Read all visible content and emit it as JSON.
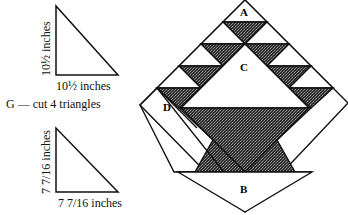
{
  "pattern_g": {
    "triangle_large": {
      "side_label_vertical": "10½ inches",
      "side_label_horizontal": "10½ inches"
    },
    "instruction": "G — cut 4 triangles",
    "triangle_small": {
      "side_label_vertical": "7 7/16 inches",
      "side_label_horizontal": "7 7/16 inches"
    }
  },
  "block_diagram": {
    "pieces": [
      {
        "label": "A"
      },
      {
        "label": "C"
      },
      {
        "label": "D"
      },
      {
        "label": "B"
      }
    ],
    "colors": {
      "dark_fill": "#3a3a3a",
      "light_fill": "#ffffff",
      "stroke": "#111111"
    }
  }
}
